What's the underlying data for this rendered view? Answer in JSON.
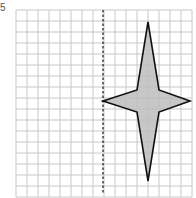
{
  "question": {
    "number": "5"
  },
  "grid": {
    "origin_x": 16,
    "origin_y": 10,
    "cell": 11,
    "cols": 16,
    "rows": 17,
    "line_color": "#c8c8c8"
  },
  "mirror_line": {
    "x": 103,
    "y1": 10,
    "y2": 193,
    "style": "dashed",
    "color": "#333333"
  },
  "shape": {
    "name": "four-pointed star",
    "fill": "#bdbdbd",
    "stroke": "#111111",
    "points": [
      [
        148,
        22
      ],
      [
        159,
        90
      ],
      [
        190,
        101
      ],
      [
        159,
        112
      ],
      [
        148,
        181
      ],
      [
        137,
        112
      ],
      [
        103,
        101
      ],
      [
        137,
        90
      ]
    ]
  }
}
